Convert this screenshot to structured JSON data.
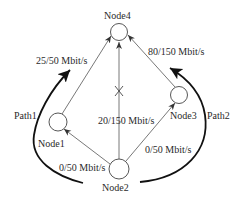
{
  "diagram": {
    "nodes": [
      {
        "id": "node4",
        "label": "Node4"
      },
      {
        "id": "node1",
        "label": "Node1"
      },
      {
        "id": "node3",
        "label": "Node3"
      },
      {
        "id": "node2",
        "label": "Node2"
      }
    ],
    "edges": [
      {
        "from": "Node1",
        "to": "Node4",
        "label": "25/50 Mbit/s"
      },
      {
        "from": "Node3",
        "to": "Node4",
        "label": "80/150 Mbit/s"
      },
      {
        "from": "Node2",
        "to": "Node4",
        "label": "20/150 Mbit/s",
        "blocked": true
      },
      {
        "from": "Node2",
        "to": "Node1",
        "label": "0/50 Mbit/s"
      },
      {
        "from": "Node2",
        "to": "Node3",
        "label": "0/50 Mbit/s"
      }
    ],
    "paths": [
      {
        "label": "Path1"
      },
      {
        "label": "Path2"
      }
    ]
  }
}
